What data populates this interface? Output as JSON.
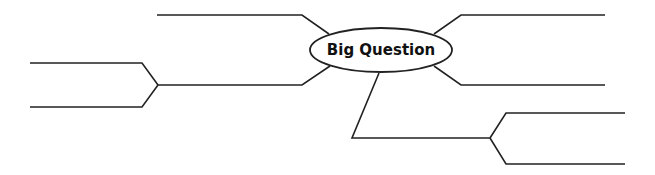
{
  "diagram": {
    "type": "mind-map",
    "center": {
      "label": "Big Question"
    },
    "branches": [
      {
        "id": "upper-left",
        "label": "",
        "sub_branches": []
      },
      {
        "id": "lower-left",
        "label": "",
        "sub_branches": [
          {
            "label": ""
          },
          {
            "label": ""
          }
        ]
      },
      {
        "id": "upper-right",
        "label": "",
        "sub_branches": []
      },
      {
        "id": "lower-right",
        "label": "",
        "sub_branches": []
      },
      {
        "id": "bottom",
        "label": "",
        "sub_branches": [
          {
            "label": ""
          },
          {
            "label": ""
          }
        ]
      }
    ],
    "colors": {
      "stroke": "#222222",
      "background": "#ffffff",
      "text": "#111111"
    }
  }
}
